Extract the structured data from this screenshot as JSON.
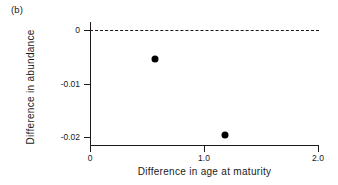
{
  "figure": {
    "panel_label": "(b)",
    "background_color": "#ffffff",
    "ink_color": "#1a1a1a"
  },
  "chart_data": {
    "type": "scatter",
    "title": "",
    "panel": "(b)",
    "xlabel": "Difference in age at maturity",
    "ylabel": "Difference in abundance",
    "xlim": [
      0,
      2.0
    ],
    "ylim": [
      -0.0215,
      0.0015
    ],
    "grid": false,
    "legend": null,
    "x_ticks": [
      0,
      1.0,
      2.0
    ],
    "x_tick_labels": [
      "0",
      "1.0",
      "2.0"
    ],
    "y_ticks": [
      0,
      -0.01,
      -0.02
    ],
    "y_tick_labels": [
      "0",
      "-0.01",
      "-0.02"
    ],
    "points": [
      {
        "x": 0.57,
        "y": -0.0055
      },
      {
        "x": 1.18,
        "y": -0.0196
      }
    ],
    "annotations": [
      {
        "type": "hline",
        "y": 0,
        "style": "dashed",
        "color": "#1a1a1a",
        "label": "zero reference line"
      }
    ]
  }
}
